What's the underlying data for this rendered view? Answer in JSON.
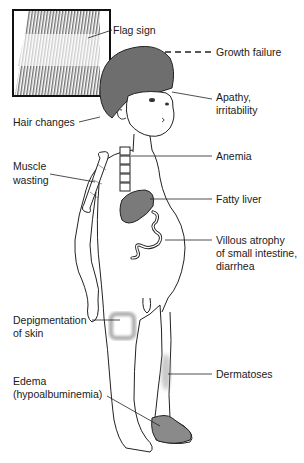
{
  "figure": {
    "inset": {
      "name": "hair-closeup-inset",
      "caption": "Flag sign"
    },
    "labels": {
      "flag_sign": "Flag sign",
      "growth_failure": "Growth failure",
      "apathy_line1": "Apathy,",
      "apathy_line2": "irritability",
      "hair_changes": "Hair changes",
      "muscle_line1": "Muscle",
      "muscle_line2": "wasting",
      "anemia": "Anemia",
      "fatty_liver": "Fatty liver",
      "villous_line1": "Villous atrophy",
      "villous_line2": "of small intestine,",
      "villous_line3": "diarrhea",
      "depig_line1": "Depigmentation",
      "depig_line2": "of skin",
      "dermatoses": "Dermatoses",
      "edema_line1": "Edema",
      "edema_line2": "(hypoalbuminemia)"
    },
    "colors": {
      "line": "#222222",
      "organ_fill": "#7a7a7a",
      "hair_fill": "#6e6e6e",
      "edema_fill": "#8a8a8a",
      "depig_halo": "#b0b0b0",
      "background": "#ffffff"
    }
  }
}
